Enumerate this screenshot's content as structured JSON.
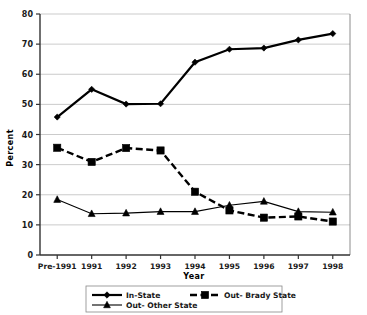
{
  "chart_data": {
    "type": "line",
    "title": "",
    "xlabel": "Year",
    "ylabel": "Percent",
    "categories": [
      "Pre-1991",
      "1991",
      "1992",
      "1993",
      "1994",
      "1995",
      "1996",
      "1997",
      "1998"
    ],
    "ylim": [
      0,
      80
    ],
    "yticks": [
      0,
      10,
      20,
      30,
      40,
      50,
      60,
      70,
      80
    ],
    "ytick_labels": [
      "0",
      "10",
      "20",
      "30",
      "40",
      "50",
      "60",
      "70",
      "80"
    ],
    "grid": true,
    "legend_position": "bottom",
    "series": [
      {
        "name": "In-State",
        "marker": "diamond",
        "line_style": "solid",
        "color": "#000000",
        "values": [
          45.8,
          55.0,
          50.1,
          50.2,
          64.0,
          68.3,
          68.7,
          71.4,
          73.5
        ]
      },
      {
        "name": "Out- Brady State",
        "marker": "square",
        "line_style": "dashed",
        "color": "#000000",
        "values": [
          35.6,
          30.9,
          35.5,
          34.7,
          21.0,
          14.8,
          12.4,
          12.8,
          11.1
        ]
      },
      {
        "name": "Out- Other State",
        "marker": "triangle",
        "line_style": "solid-thin",
        "color": "#000000",
        "values": [
          18.4,
          13.7,
          13.9,
          14.4,
          14.4,
          16.5,
          17.8,
          14.4,
          14.2
        ]
      }
    ]
  },
  "axes": {
    "y_title": "Percent",
    "x_title": "Year"
  },
  "legend": {
    "entries": [
      {
        "label": "In-State",
        "marker": "diamond-icon"
      },
      {
        "label": "Out- Brady State",
        "marker": "square-icon"
      },
      {
        "label": "Out- Other State",
        "marker": "triangle-icon"
      }
    ]
  }
}
